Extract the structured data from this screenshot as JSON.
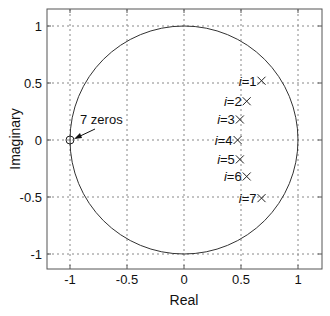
{
  "chart_data": {
    "type": "scatter",
    "title": "",
    "xlabel": "Real",
    "ylabel": "Imaginary",
    "xlim": [
      -1.2,
      1.2
    ],
    "ylim": [
      -1.2,
      1.2
    ],
    "grid": true,
    "xticks": [
      -1,
      -0.5,
      0,
      0.5,
      1
    ],
    "xtick_labels": [
      "-1",
      "-0.5",
      "0",
      "0.5",
      "1"
    ],
    "yticks": [
      1,
      0.5,
      0,
      -0.5,
      -1
    ],
    "ytick_labels": [
      "1",
      "0.5",
      "0",
      "-0.5",
      "-1"
    ],
    "unit_circle": {
      "center": [
        0,
        0
      ],
      "radius": 1
    },
    "series": [
      {
        "name": "zeros",
        "marker": "o",
        "points": [
          {
            "x": -1,
            "y": 0
          }
        ],
        "multiplicity": 7
      },
      {
        "name": "poles",
        "marker": "x",
        "points": [
          {
            "label": "i=1",
            "x": 0.68,
            "y": 0.52
          },
          {
            "label": "i=2",
            "x": 0.55,
            "y": 0.34
          },
          {
            "label": "i=3",
            "x": 0.49,
            "y": 0.18
          },
          {
            "label": "i=4",
            "x": 0.47,
            "y": 0.0
          },
          {
            "label": "i=5",
            "x": 0.49,
            "y": -0.17
          },
          {
            "label": "i=6",
            "x": 0.55,
            "y": -0.32
          },
          {
            "label": "i=7",
            "x": 0.68,
            "y": -0.51
          }
        ]
      }
    ],
    "annotations": [
      {
        "text": "7 zeros",
        "arrow_to": {
          "x": -1,
          "y": 0
        }
      }
    ]
  },
  "labels": {
    "xlabel": "Real",
    "ylabel": "Imaginary",
    "zeros_annotation": "7 zeros",
    "pole_prefix": "i=",
    "pole_indices": [
      "1",
      "2",
      "3",
      "4",
      "5",
      "6",
      "7"
    ]
  }
}
